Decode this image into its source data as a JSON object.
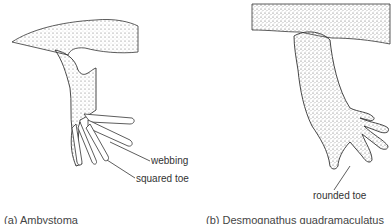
{
  "figure": {
    "panels": [
      {
        "id": "a",
        "caption": "(a) Ambystoma",
        "labels": {
          "webbing": "webbing",
          "squared_toe": "squared toe"
        }
      },
      {
        "id": "b",
        "caption": "(b) Desmognathus quadramaculatus",
        "labels": {
          "rounded_toe": "rounded toe"
        }
      }
    ],
    "colors": {
      "ink": "#2a2a2a",
      "stipple": "#555555",
      "background": "#ffffff"
    }
  }
}
